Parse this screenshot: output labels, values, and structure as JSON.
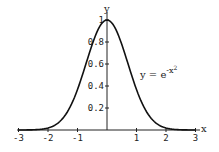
{
  "chart_data": {
    "type": "line",
    "title": "",
    "xlabel": "x",
    "ylabel": "y",
    "annotation": "y = e^(-x^2)",
    "annotation_text": "y = e",
    "annotation_exp": "-x",
    "annotation_exp2": "2",
    "xlim": [
      -3,
      3
    ],
    "ylim": [
      0,
      1
    ],
    "grid": false,
    "x_ticks": [
      -3,
      -2,
      -1,
      1,
      2,
      3
    ],
    "x_tick_labels": [
      "-3",
      "-2",
      "-1",
      "1",
      "2",
      "3"
    ],
    "y_ticks": [
      0.2,
      0.4,
      0.6,
      0.8,
      1
    ],
    "y_tick_labels": [
      "0.2",
      "0.4",
      "0.6",
      "0.8",
      "1"
    ],
    "series": [
      {
        "name": "y = e^(-x^2)",
        "x": [
          -3,
          -2.5,
          -2,
          -1.5,
          -1,
          -0.5,
          0,
          0.5,
          1,
          1.5,
          2,
          2.5,
          3
        ],
        "y": [
          0.0001,
          0.0019,
          0.0183,
          0.1054,
          0.3679,
          0.7788,
          1.0,
          0.7788,
          0.3679,
          0.1054,
          0.0183,
          0.0019,
          0.0001
        ]
      }
    ]
  }
}
